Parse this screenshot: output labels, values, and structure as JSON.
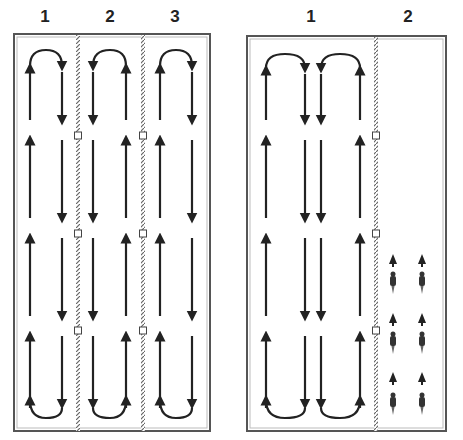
{
  "left_panel": {
    "labels": [
      "1",
      "2",
      "3"
    ],
    "lanes": 3
  },
  "right_panel": {
    "labels": [
      "1",
      "2"
    ],
    "lanes": 2
  },
  "colors": {
    "line": "#222222",
    "frame": "#555555",
    "rope": "#888888"
  }
}
